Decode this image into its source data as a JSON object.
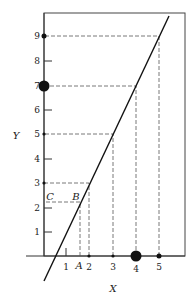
{
  "diagram": {
    "type": "linear-function-mapping",
    "axes": {
      "x_label": "X",
      "y_label": "Y",
      "x_ticks": [
        "1",
        "2",
        "3",
        "4",
        "5"
      ],
      "y_ticks": [
        "1",
        "2",
        "3",
        "4",
        "5",
        "6",
        "7",
        "8",
        "9"
      ]
    },
    "point_labels": {
      "a": "A",
      "b": "B",
      "c": "C"
    },
    "line": {
      "description": "straight line Y = 2X - 1 (approx.)",
      "color": "#111111"
    },
    "mapped_pairs": [
      {
        "x": "2",
        "y": "3"
      },
      {
        "x": "3",
        "y": "5"
      },
      {
        "x": "4",
        "y": "7",
        "emphasized": true
      },
      {
        "x": "5",
        "y": "9"
      },
      {
        "x": "A",
        "y": "C",
        "via": "B"
      }
    ],
    "colors": {
      "ink": "#111111",
      "dash": "#555555",
      "background": "#ffffff"
    }
  }
}
